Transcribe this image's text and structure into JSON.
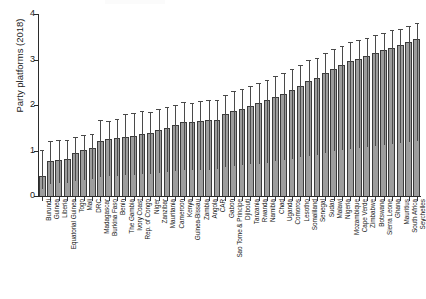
{
  "chart_data": {
    "type": "bar",
    "title": "",
    "xlabel": "",
    "ylabel": "Party platforms (2018)",
    "ylim": [
      0,
      4
    ],
    "yticks": [
      0,
      1,
      2,
      3,
      4
    ],
    "ytick_labels": [
      "0",
      "1",
      "2",
      "3",
      "4"
    ],
    "grid": false,
    "legend": "none",
    "error_bars": "upper-only whisker with cap",
    "categories": [
      "Burundi",
      "Guinea",
      "Liberia",
      "Equatorial Guinea",
      "Togo",
      "Mali",
      "DRC",
      "Madagascar",
      "Burkina Faso",
      "Benin",
      "The Gambia",
      "Ivory Coast",
      "Rep. of Congo",
      "Niger",
      "Zanzibar",
      "Mauritania",
      "Cameroon",
      "Kenya",
      "Guinea-Bissau",
      "Zambia",
      "Angola",
      "CAR",
      "Gabon",
      "Sao Tome & Principe",
      "Djibouti",
      "Tanzania",
      "Rwanda",
      "Namibia",
      "Chad",
      "Uganda",
      "Comoros",
      "Lesotho",
      "Somaliland",
      "Senegal",
      "Sudan",
      "Malawi",
      "Nigeria",
      "Mozambique",
      "Cape Verde",
      "Zimbabwe",
      "Botswana",
      "Sierra Leone",
      "Ghana",
      "Mauritius",
      "South Africa",
      "Seychelles"
    ],
    "values": [
      0.45,
      0.78,
      0.8,
      0.82,
      0.95,
      1.02,
      1.05,
      1.22,
      1.26,
      1.28,
      1.3,
      1.32,
      1.36,
      1.38,
      1.46,
      1.5,
      1.55,
      1.62,
      1.63,
      1.64,
      1.66,
      1.68,
      1.8,
      1.86,
      1.92,
      1.98,
      2.04,
      2.1,
      2.18,
      2.24,
      2.34,
      2.42,
      2.52,
      2.6,
      2.7,
      2.8,
      2.88,
      2.96,
      3.02,
      3.08,
      3.14,
      3.2,
      3.26,
      3.32,
      3.38,
      3.45
    ],
    "upper_error": [
      1.02,
      1.2,
      1.22,
      1.24,
      1.3,
      1.34,
      1.36,
      1.68,
      1.64,
      1.7,
      1.8,
      1.82,
      1.86,
      1.84,
      1.92,
      1.96,
      2.0,
      2.06,
      2.05,
      2.08,
      2.1,
      2.12,
      2.22,
      2.3,
      2.36,
      2.42,
      2.48,
      2.54,
      2.64,
      2.7,
      2.8,
      2.88,
      2.98,
      3.04,
      3.14,
      3.24,
      3.3,
      3.38,
      3.42,
      3.48,
      3.54,
      3.58,
      3.64,
      3.68,
      3.74,
      3.8
    ],
    "colors": {
      "bar_fill": "#9d9d9d",
      "bar_edge": "#3b3b3b",
      "error_bar": "#4a4a4a",
      "axis": "#2b2b2b",
      "text": "#151515",
      "background": "#ffffff"
    }
  }
}
